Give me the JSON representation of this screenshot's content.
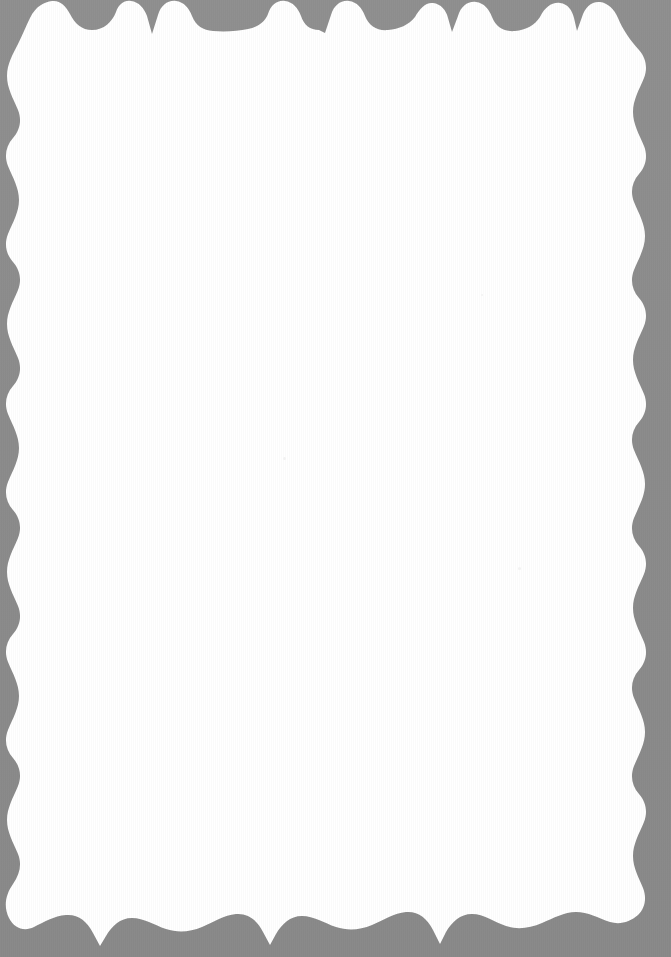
{
  "document": {
    "kind": "scanned-page",
    "title": "Blank scanned page with decorative scalloped border",
    "page_body_text": "",
    "page_number": "",
    "width_px": 671,
    "height_px": 957
  },
  "colors": {
    "page_background": "#ffffff",
    "border_gray": "#8c8c8c",
    "border_gray_light": "#9a9a9a",
    "speck_gray": "#f2f2f2"
  },
  "border": {
    "name": "scalloped-wavy-frame",
    "style": "scalloped",
    "top_label": "top-scallop-edge",
    "right_label": "right-scallop-edge",
    "bottom_label": "bottom-scallop-edge",
    "left_label": "left-scallop-edge",
    "top_inset_px": 0,
    "right_inset_px": 30,
    "bottom_inset_px": 25,
    "left_inset_px": 22
  },
  "content": {
    "body": "",
    "note": ""
  }
}
